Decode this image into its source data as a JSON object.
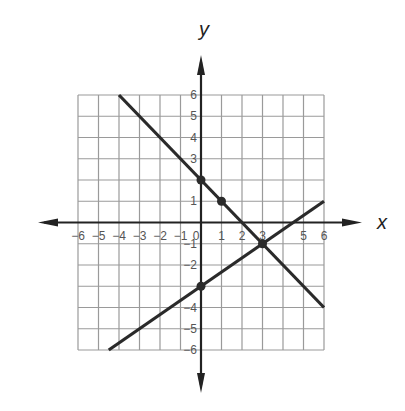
{
  "chart_data": {
    "type": "line",
    "title": "",
    "xlabel": "x",
    "ylabel": "y",
    "xlim": [
      -6,
      6
    ],
    "ylim": [
      -6,
      6
    ],
    "grid": true,
    "x_ticks": [
      -6,
      -5,
      -4,
      -3,
      -2,
      -1,
      0,
      1,
      2,
      3,
      5,
      6
    ],
    "y_ticks": [
      6,
      5,
      4,
      3,
      1,
      -1,
      -2,
      -4,
      -5,
      -6
    ],
    "x_tick_labels": [
      "−6",
      "−5",
      "−4",
      "−3",
      "−2",
      "−1",
      "0",
      "1",
      "2",
      "3",
      "5",
      "6"
    ],
    "y_tick_labels": [
      "6",
      "5",
      "4",
      "3",
      "1",
      "−1",
      "−2",
      "−4",
      "−5",
      "−6"
    ],
    "series": [
      {
        "name": "line-1",
        "equation": "y = -x + 2",
        "endpoints": [
          [
            -4,
            6
          ],
          [
            6,
            -4
          ]
        ],
        "marked_points": [
          [
            0,
            2
          ],
          [
            1,
            1
          ]
        ]
      },
      {
        "name": "line-2",
        "equation": "y = (2/3)x - 3",
        "endpoints": [
          [
            -4.5,
            -6
          ],
          [
            6,
            1
          ]
        ],
        "marked_points": [
          [
            0,
            -3
          ],
          [
            3,
            -1
          ]
        ]
      }
    ],
    "intersection": [
      3,
      -1
    ]
  },
  "colors": {
    "grid": "#9a9a9a",
    "axis": "#222222",
    "line": "#2a2a2a",
    "tick_text": "#555555"
  }
}
